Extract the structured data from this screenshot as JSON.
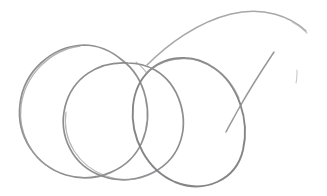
{
  "image": {
    "kind": "pencil-sketch",
    "medium": "graphite on white paper",
    "width": 327,
    "height": 196,
    "background_color": "#ffffff",
    "subject": "three overlapping hand-drawn circles with a large sweeping arc",
    "alt_text": "A loose pencil sketch of three overlapping circles arranged left to right, with a long curved arc sweeping over the top right and a diagonal tail descending through the right circle, plus a small faint tick mark at far right."
  },
  "palette": {
    "paper": "#ffffff",
    "graphite_dark": "#7d7d7f",
    "graphite_mid": "#8e8e90",
    "graphite_light": "#a9a9ab",
    "graphite_faint": "#c4c4c6"
  },
  "strokes": [
    {
      "name": "circle-left",
      "role": "leftmost circle outline",
      "color": "#8a8a8c",
      "width": 1.7,
      "opacity": 0.95,
      "path": "M 84 45 C 52 46 24 71 20 104 C 16 136 36 166 66 175 C 96 184 130 170 142 142 C 154 114 146 78 122 60 C 110 50 97 45 84 45 Z"
    },
    {
      "name": "circle-left-overdraw",
      "role": "second pass on leftmost circle, upper arc",
      "color": "#9a9a9c",
      "width": 1.3,
      "opacity": 0.75,
      "path": "M 80 46 C 50 50 25 75 21 106 C 18 132 31 158 54 170"
    },
    {
      "name": "circle-middle",
      "role": "middle circle outline",
      "color": "#87878a",
      "width": 1.7,
      "opacity": 0.95,
      "path": "M 128 63 C 98 61 72 78 65 107 C 58 136 73 166 102 176 C 133 187 168 172 179 145 C 190 118 179 84 155 70 C 146 65 137 63 128 63 Z"
    },
    {
      "name": "circle-middle-overdraw",
      "role": "second pass on middle circle, lower left arc",
      "color": "#9b9b9d",
      "width": 1.2,
      "opacity": 0.7,
      "path": "M 66 112 C 62 140 78 166 106 176 C 124 182 142 180 157 171"
    },
    {
      "name": "circle-right",
      "role": "rightmost circle outline",
      "color": "#818184",
      "width": 1.9,
      "opacity": 0.97,
      "path": "M 185 58 C 157 57 136 76 133 106 C 130 138 147 170 175 182 C 205 194 236 180 243 150 C 250 120 238 84 214 68 C 205 62 195 58 185 58 Z"
    },
    {
      "name": "circle-right-overdraw",
      "role": "second pass on right circle, top arc",
      "color": "#979799",
      "width": 1.2,
      "opacity": 0.7,
      "path": "M 147 72 C 160 61 178 56 196 60 C 214 64 230 78 239 98"
    },
    {
      "name": "arc-top-sweep",
      "role": "large sweeping arc across the top right",
      "color": "#9d9d9f",
      "width": 1.6,
      "opacity": 0.9,
      "path": "M 147 65 C 168 44 198 22 231 14 C 264 6 291 17 306 31"
    },
    {
      "name": "arc-top-sweep-tail",
      "role": "light continuation of the top arc toward the right edge",
      "color": "#bcbcbe",
      "width": 1.2,
      "opacity": 0.8,
      "path": "M 292 22 C 298 25 303 29 307 33"
    },
    {
      "name": "diagonal-tail",
      "role": "diagonal stroke descending from upper right through the right circle",
      "color": "#8d8d90",
      "width": 1.5,
      "opacity": 0.9,
      "path": "M 274 52 C 262 70 248 92 238 110 C 232 121 228 128 226 132"
    },
    {
      "name": "tick-mark",
      "role": "small faint vertical tick at far right",
      "color": "#c0c0c2",
      "width": 1.1,
      "opacity": 0.85,
      "path": "M 297 70 C 297 75 297 79 296 83"
    },
    {
      "name": "junction-wisp",
      "role": "short wisp at the top junction where circles meet",
      "color": "#9e9ea0",
      "width": 1.1,
      "opacity": 0.7,
      "path": "M 136 62 C 141 66 145 70 147 74"
    }
  ]
}
